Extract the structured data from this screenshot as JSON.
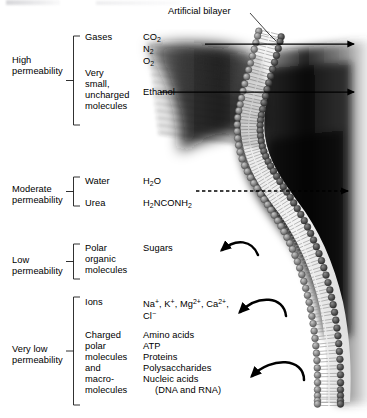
{
  "figure": {
    "caption_label": "Artificial bilayer",
    "permeability_groups": [
      {
        "permeability": "High\npermeability",
        "rows": [
          {
            "category": "Gases",
            "examples": "CO₂\nN₂\nO₂",
            "transport": "passes"
          },
          {
            "category": "Very\nsmall,\nuncharged\nmolecules",
            "examples": "Ethanol",
            "transport": "passes"
          }
        ]
      },
      {
        "permeability": "Moderate\npermeability",
        "rows": [
          {
            "category": "Water",
            "examples": "H₂O",
            "transport": "passes-slowly"
          },
          {
            "category": "Urea",
            "examples": "H₂NCONH₂",
            "transport": "passes-slowly"
          }
        ]
      },
      {
        "permeability": "Low\npermeability",
        "rows": [
          {
            "category": "Polar\norganic\nmolecules",
            "examples": "Sugars",
            "transport": "blocked"
          }
        ]
      },
      {
        "permeability": "Very low\npermeability",
        "rows": [
          {
            "category": "Ions",
            "examples": "Na⁺, K⁺, Mg²⁺, Ca²⁺,\nCl⁻",
            "transport": "blocked"
          },
          {
            "category": "Charged\npolar\nmolecules\nand\nmacro-\nmolecules",
            "examples": "Amino acids\nATP\nProteins\nPolysaccharides\nNucleic acids\n   (DNA and RNA)",
            "transport": "blocked"
          }
        ]
      }
    ],
    "labels": {
      "high_permeability": "High",
      "high_permeability_2": "permeability",
      "moderate_permeability": "Moderate",
      "moderate_permeability_2": "permeability",
      "low_permeability": "Low",
      "low_permeability_2": "permeability",
      "verylow_permeability": "Very low",
      "verylow_permeability_2": "permeability",
      "cat_gases": "Gases",
      "cat_very": "Very",
      "cat_small": "small,",
      "cat_uncharged": "uncharged",
      "cat_molecules": "molecules",
      "cat_water": "Water",
      "cat_urea": "Urea",
      "cat_polar": "Polar",
      "cat_organic": "organic",
      "cat_molecules2": "molecules",
      "cat_ions": "Ions",
      "cat_charged": "Charged",
      "cat_polar2": "polar",
      "cat_molecules3": "molecules",
      "cat_and": "and",
      "cat_macro": "macro-",
      "cat_molecules4": "molecules",
      "ex_ethanol": "Ethanol",
      "ex_sugars": "Sugars",
      "ex_amino": "Amino acids",
      "ex_atp": "ATP",
      "ex_proteins": "Proteins",
      "ex_polysacch": "Polysaccharides",
      "ex_nucleic": "Nucleic acids",
      "ex_dnarna": "(DNA and RNA)"
    },
    "colors": {
      "ink": "#000000",
      "head_group": "#8a8a8a",
      "tail": "#d8d8d8",
      "shadow": "#141414",
      "background": "#ffffff"
    }
  }
}
